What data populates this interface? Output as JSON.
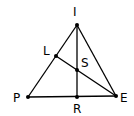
{
  "diagram": {
    "type": "geometry-triangle",
    "stroke_color": "#000000",
    "points": {
      "I": {
        "label": "I",
        "x": 77,
        "y": 25
      },
      "L": {
        "label": "L",
        "x": 56,
        "y": 56
      },
      "S": {
        "label": "S",
        "x": 77,
        "y": 70
      },
      "P": {
        "label": "P",
        "x": 28,
        "y": 97
      },
      "R": {
        "label": "R",
        "x": 77,
        "y": 97
      },
      "E": {
        "label": "E",
        "x": 116,
        "y": 96
      }
    },
    "segments": [
      [
        "P",
        "I"
      ],
      [
        "I",
        "E"
      ],
      [
        "P",
        "E"
      ],
      [
        "I",
        "R"
      ],
      [
        "L",
        "E"
      ]
    ]
  }
}
